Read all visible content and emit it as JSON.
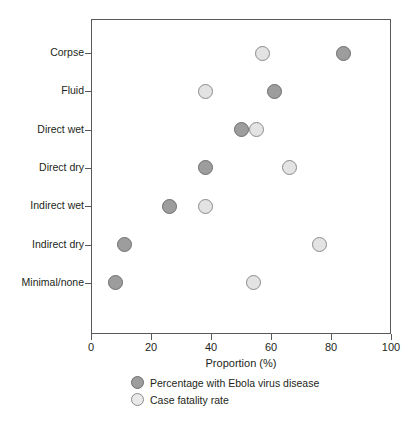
{
  "chart_data": {
    "type": "scatter",
    "title": "",
    "xlabel": "Proportion (%)",
    "ylabel": "",
    "xlim": [
      0,
      100
    ],
    "xticks": [
      0,
      20,
      40,
      60,
      80,
      100
    ],
    "xtick_labels": [
      "0",
      "20",
      "40",
      "60",
      "80",
      "100"
    ],
    "grid": false,
    "legend_position": "bottom-center",
    "categories": [
      "Corpse",
      "Fluid",
      "Direct wet",
      "Direct dry",
      "Indirect wet",
      "Indirect dry",
      "Minimal/none"
    ],
    "series": [
      {
        "name": "Percentage with Ebola virus disease",
        "marker": "filled-dark-circle",
        "color": "#9d9d9d",
        "edge_color": "#6d6e71",
        "values": [
          84,
          61,
          50,
          38,
          26,
          11,
          8
        ]
      },
      {
        "name": "Case fatality rate",
        "marker": "filled-light-circle",
        "color": "#e3e3e3",
        "edge_color": "#8a8b8d",
        "values": [
          57,
          38,
          55,
          66,
          38,
          76,
          54
        ]
      }
    ]
  },
  "axis": {
    "x_title": "Proportion (%)",
    "tick_labels": [
      "0",
      "20",
      "40",
      "60",
      "80",
      "100"
    ],
    "category_labels": [
      "Corpse",
      "Fluid",
      "Direct wet",
      "Direct dry",
      "Indirect wet",
      "Indirect dry",
      "Minimal/none"
    ]
  },
  "legend": {
    "items": [
      {
        "label": "Percentage with Ebola virus disease",
        "style": "dark"
      },
      {
        "label": "Case fatality rate",
        "style": "light"
      }
    ]
  },
  "caption": {
    "text": ""
  }
}
